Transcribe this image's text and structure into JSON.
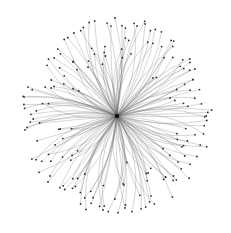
{
  "diagram": {
    "type": "radial-network",
    "background": "#ffffff",
    "edge_color": "#6a6a6a",
    "node_color": "#2a2a2a",
    "hub": {
      "x": 117,
      "y": 116,
      "r": 2.2,
      "color": "#111111"
    },
    "extent": {
      "rx": 97,
      "ry": 99
    },
    "leaf_count": 180,
    "seed": 7,
    "node_radius": 0.9,
    "curvature": 0.22
  }
}
